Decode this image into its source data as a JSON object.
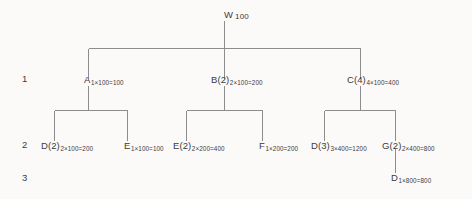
{
  "diagram": {
    "type": "bill-of-materials-tree",
    "level_labels": [
      "1",
      "2",
      "3"
    ],
    "nodes": [
      {
        "id": "W",
        "name": "W",
        "sub": "100",
        "level": 0
      },
      {
        "id": "A",
        "name": "A",
        "sub": "1×100=100",
        "level": 1
      },
      {
        "id": "B2",
        "name": "B(2)",
        "sub": "2×100=200",
        "level": 1
      },
      {
        "id": "C4",
        "name": "C(4)",
        "sub": "4×100=400",
        "level": 1
      },
      {
        "id": "D2",
        "name": "D(2)",
        "sub": "2×100=200",
        "level": 2
      },
      {
        "id": "E",
        "name": "E",
        "sub": "1×100=100",
        "level": 2
      },
      {
        "id": "E2",
        "name": "E(2)",
        "sub": "2×200=400",
        "level": 2
      },
      {
        "id": "F",
        "name": "F",
        "sub": "1×200=200",
        "level": 2
      },
      {
        "id": "D3",
        "name": "D(3)",
        "sub": "3×400=1200",
        "level": 2
      },
      {
        "id": "G2",
        "name": "G(2)",
        "sub": "2×400=800",
        "level": 2
      },
      {
        "id": "Dbot",
        "name": "D",
        "sub": "1×800=800",
        "level": 3
      }
    ],
    "line_color": "#8d8d8d",
    "background_color": "#fbfaf8",
    "text_color": "#3b3b3b"
  }
}
